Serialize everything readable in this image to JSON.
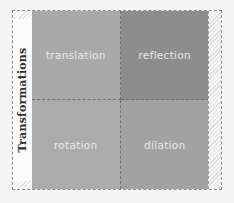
{
  "diagram": {
    "row_label": "Transformations",
    "cells": [
      {
        "label": "translation",
        "color": "#a9a9a9"
      },
      {
        "label": "reflection",
        "color": "#8d8d8d"
      },
      {
        "label": "rotation",
        "color": "#ababab"
      },
      {
        "label": "dilation",
        "color": "#a2a2a2"
      }
    ]
  }
}
